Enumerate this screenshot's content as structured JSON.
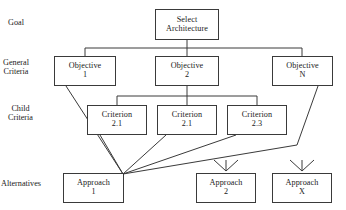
{
  "diagram": {
    "type": "hierarchy-tree",
    "stroke_color": "#3a3a3a",
    "background_color": "#ffffff",
    "width": 346,
    "height": 210
  },
  "tier_labels": [
    {
      "id": "goal",
      "line1": "Goal",
      "line2": "",
      "x": 8,
      "y": 18
    },
    {
      "id": "general",
      "line1": "General",
      "line2": "Criteria",
      "x": 3,
      "y": 58
    },
    {
      "id": "child",
      "line1": "Child",
      "line2": "Criteria",
      "x": 8,
      "y": 104
    },
    {
      "id": "alternatives",
      "line1": "Alternatives",
      "line2": "",
      "x": 1,
      "y": 179
    }
  ],
  "nodes": [
    {
      "id": "goal",
      "line1": "Select",
      "line2": "Architecture",
      "x": 155,
      "y": 9,
      "w": 64,
      "h": 31
    },
    {
      "id": "objective-1",
      "line1": "Objective",
      "line2": "1",
      "x": 54,
      "y": 56,
      "w": 62,
      "h": 30
    },
    {
      "id": "objective-2",
      "line1": "Objective",
      "line2": "2",
      "x": 155,
      "y": 56,
      "w": 64,
      "h": 30
    },
    {
      "id": "objective-n",
      "line1": "Objective",
      "line2": "N",
      "x": 272,
      "y": 56,
      "w": 61,
      "h": 30
    },
    {
      "id": "criterion-21",
      "line1": "Criterion",
      "line2": "2.1",
      "x": 87,
      "y": 105,
      "w": 60,
      "h": 30
    },
    {
      "id": "criterion-22",
      "line1": "Criterion",
      "line2": "2.1",
      "x": 157,
      "y": 105,
      "w": 60,
      "h": 30
    },
    {
      "id": "criterion-23",
      "line1": "Criterion",
      "line2": "2.3",
      "x": 227,
      "y": 105,
      "w": 60,
      "h": 30
    },
    {
      "id": "approach-1",
      "line1": "Approach",
      "line2": "1",
      "x": 63,
      "y": 173,
      "w": 61,
      "h": 30
    },
    {
      "id": "approach-2",
      "line1": "Approach",
      "line2": "2",
      "x": 196,
      "y": 173,
      "w": 60,
      "h": 30
    },
    {
      "id": "approach-x",
      "line1": "Approach",
      "line2": "X",
      "x": 272,
      "y": 173,
      "w": 60,
      "h": 30
    }
  ],
  "connections": {
    "goal_to_objectives": {
      "description": "Goal drops to a horizontal bus that feeds all three objectives",
      "bus_y": 48,
      "drop_from_x": 187,
      "drop_from_y": 40,
      "bus_left_x": 85,
      "bus_right_x": 302,
      "stub_targets_x": [
        85,
        187,
        302
      ],
      "stub_bottom_y": 56
    },
    "objective2_to_criteria": {
      "description": "Objective 2 drops to a horizontal bus feeding the three child criteria",
      "bus_y": 96,
      "drop_from_x": 187,
      "drop_from_y": 86,
      "bus_left_x": 117,
      "bus_right_x": 257,
      "stub_targets_x": [
        117,
        187,
        257
      ],
      "stub_bottom_y": 105
    },
    "to_approach_1": {
      "description": "Objective 1, all three criteria, and Objective N converge on the upper-right corner of Approach 1",
      "converge_x": 123,
      "converge_y": 174,
      "edges": [
        {
          "from": "objective-1",
          "from_x": 66,
          "from_y": 86
        },
        {
          "from": "criterion-21",
          "from_x": 100,
          "from_y": 135
        },
        {
          "from": "criterion-22",
          "from_x": 166,
          "from_y": 135
        },
        {
          "from": "criterion-23",
          "from_x": 236,
          "from_y": 135
        }
      ],
      "objective_n_path": [
        {
          "x": 318,
          "y": 86
        },
        {
          "x": 297,
          "y": 145
        },
        {
          "x": 123,
          "y": 174
        }
      ]
    },
    "approach_stubs": {
      "description": "Three short converging tick marks above Approach 2 and Approach X, indicating implied incoming links",
      "groups": [
        {
          "target": "approach-2",
          "apex_x": 226,
          "apex_y": 171,
          "top_y": 160,
          "spread": [
            -12,
            0,
            12
          ]
        },
        {
          "target": "approach-x",
          "apex_x": 302,
          "apex_y": 171,
          "top_y": 160,
          "spread": [
            -12,
            0,
            12
          ]
        }
      ]
    }
  }
}
